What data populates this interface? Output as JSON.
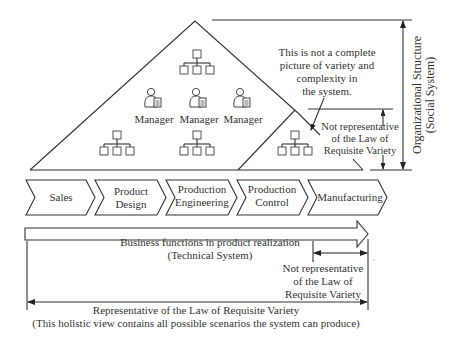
{
  "diagram": {
    "social_system": {
      "managers": [
        {
          "label": "Manager"
        },
        {
          "label": "Manager"
        },
        {
          "label": "Manager"
        }
      ],
      "note": {
        "lines": [
          "This is not a complete",
          "picture of variety and",
          "complexity in",
          "the system."
        ]
      },
      "inner_note": {
        "lines": [
          "Not representative",
          "of the Law of",
          "Requisite Variety"
        ]
      },
      "axis_label": {
        "lines": [
          "Organizational Structure",
          "(Social System)"
        ]
      },
      "org_chart_icons": [
        "org-chart-top",
        "org-chart-bottom-left",
        "org-chart-bottom-center",
        "org-chart-small-triangle"
      ]
    },
    "business_functions": {
      "steps": [
        {
          "lines": [
            "Sales"
          ]
        },
        {
          "lines": [
            "Product",
            "Design"
          ]
        },
        {
          "lines": [
            "Production",
            "Engineering"
          ]
        },
        {
          "lines": [
            "Production",
            "Control"
          ]
        },
        {
          "lines": [
            "Manufacturing"
          ]
        }
      ],
      "arrow_caption": {
        "lines": [
          "Business functions in product realization",
          "(Technical System)"
        ]
      }
    },
    "technical_note": {
      "lines": [
        "Not representative",
        "of the Law of",
        "Requisite Variety"
      ]
    },
    "holistic_note": {
      "lines": [
        "Representative of the Law of Requisite Variety",
        "(This holistic view contains all possible scenarios the system can produce)"
      ]
    },
    "colors": {
      "line": "#333333",
      "background": "#ffffff",
      "text": "#333333"
    }
  }
}
